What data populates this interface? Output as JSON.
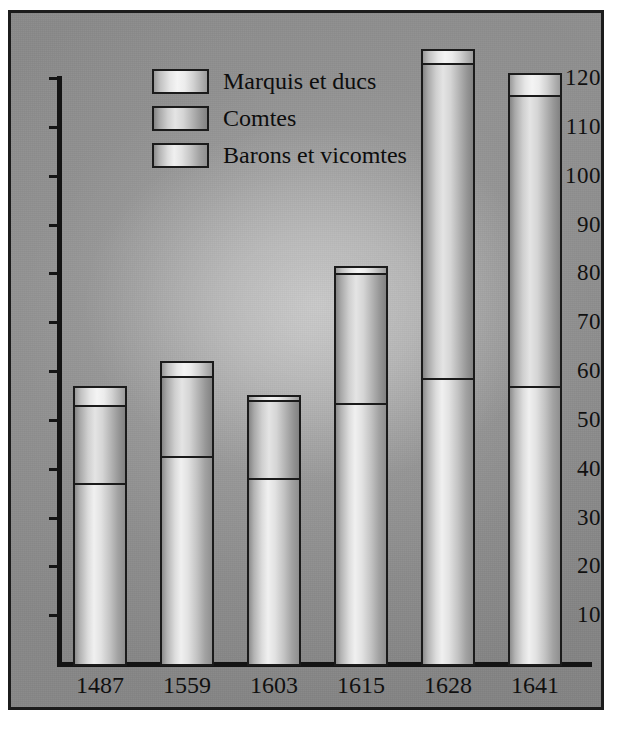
{
  "chart_data": {
    "type": "bar",
    "subtype": "stacked-vertical",
    "title": "",
    "xlabel": "",
    "ylabel": "",
    "categories": [
      "1487",
      "1559",
      "1603",
      "1615",
      "1628",
      "1641"
    ],
    "series": [
      {
        "name": "Barons et vicomtes",
        "values": [
          37,
          42.5,
          38,
          53.5,
          58.5,
          57
        ]
      },
      {
        "name": "Comtes",
        "values": [
          16,
          16.5,
          16,
          26.5,
          64.5,
          59.5
        ]
      },
      {
        "name": "Marquis et ducs",
        "values": [
          4,
          3,
          1,
          1.5,
          3,
          4.5
        ]
      }
    ],
    "cumulative_tops": {
      "barons": [
        37,
        42.5,
        38,
        53.5,
        58.5,
        57
      ],
      "comtes": [
        53,
        59,
        54,
        80,
        123,
        116.5
      ],
      "total": [
        57,
        62,
        55,
        81.5,
        126,
        121
      ]
    },
    "ylim": [
      0,
      130
    ],
    "yticks": [
      10,
      20,
      30,
      40,
      50,
      60,
      70,
      80,
      90,
      100,
      110,
      120
    ],
    "ytick_labels": [
      "10",
      "20",
      "30",
      "40",
      "50",
      "60",
      "70",
      "80",
      "90",
      "100",
      "110",
      "120"
    ],
    "grid": false,
    "legend_position": "top-center"
  },
  "legend": {
    "items": [
      {
        "label": "Marquis et ducs",
        "swatch": "marquis-swatch"
      },
      {
        "label": "Comtes",
        "swatch": "comtes-swatch"
      },
      {
        "label": "Barons et vicomtes",
        "swatch": "barons-swatch"
      }
    ]
  },
  "colors": {
    "frame": "#1c1c1c",
    "background": "#8e8e8e",
    "axis": "#141414",
    "text": "#101010"
  }
}
